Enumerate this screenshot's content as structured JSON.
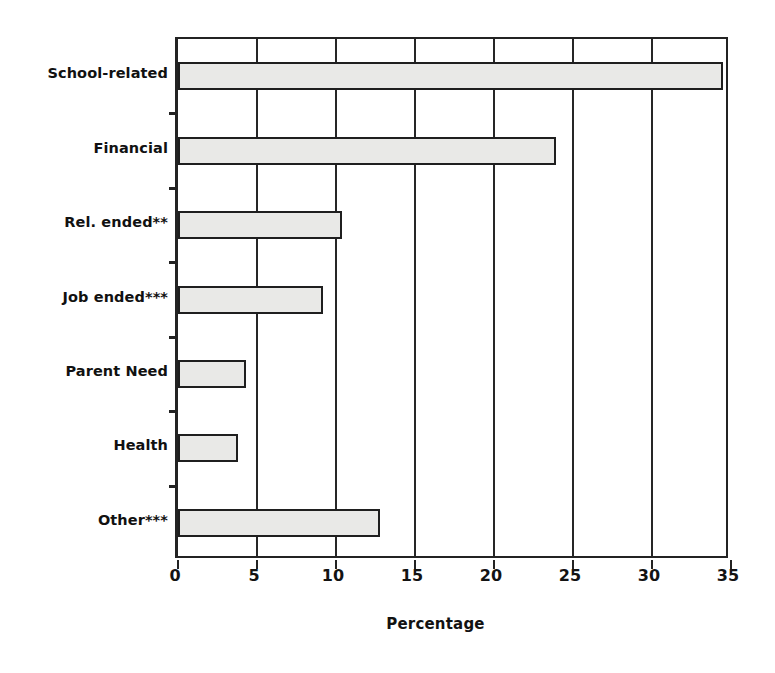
{
  "chart_data": {
    "type": "bar",
    "orientation": "horizontal",
    "title": "",
    "title_visible": false,
    "xlabel": "Percentage",
    "ylabel": "",
    "xlim": [
      0,
      35
    ],
    "xticks": [
      0,
      5,
      10,
      15,
      20,
      25,
      30,
      35
    ],
    "xtick_labels": [
      "0",
      "5",
      "10",
      "15",
      "20",
      "25",
      "30",
      "35"
    ],
    "grid": "vertical",
    "legend": "none",
    "bar_fill_color": "#e9e9e7",
    "bar_edge_color": "#1f1f1f",
    "categories": [
      "School-related",
      "Financial",
      "Rel. ended**",
      "Job ended***",
      "Parent Need",
      "Health",
      "Other***"
    ],
    "values": [
      34.5,
      23.9,
      10.4,
      9.2,
      4.3,
      3.8,
      12.8
    ],
    "series": [
      {
        "name": "Percentage",
        "values": [
          34.5,
          23.9,
          10.4,
          9.2,
          4.3,
          3.8,
          12.8
        ]
      }
    ]
  }
}
